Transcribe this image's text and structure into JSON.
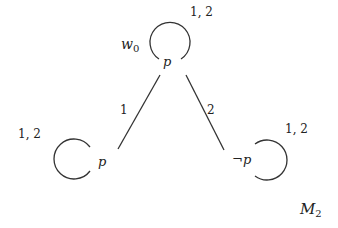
{
  "model_label": "M",
  "model_subscript": "2",
  "world_name": "w",
  "world_subscript": "0",
  "worlds": [
    {
      "id": "w0",
      "valuation": "p",
      "loop_label": "1, 2"
    },
    {
      "id": "left",
      "valuation": "p",
      "loop_label": "1, 2"
    },
    {
      "id": "right",
      "valuation": "¬p",
      "loop_label": "1, 2"
    }
  ],
  "edges": [
    {
      "from": "w0",
      "to": "left",
      "label": "1"
    },
    {
      "from": "w0",
      "to": "right",
      "label": "2"
    }
  ],
  "colors": {
    "stroke": "#333333",
    "text": "#222222"
  }
}
